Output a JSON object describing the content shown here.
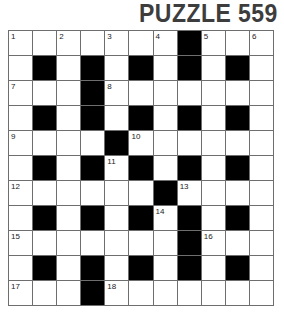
{
  "title": "PUZZLE 559",
  "grid": {
    "rows": 11,
    "cols": 11,
    "colors": {
      "black": "#000000",
      "white": "#ffffff",
      "line": "#6e6e6e",
      "title": "#3d3d3d"
    },
    "layout": [
      [
        "1",
        "",
        "2",
        "",
        "3",
        "",
        "4",
        "#",
        "5",
        "",
        "6"
      ],
      [
        "",
        "#",
        "",
        "#",
        "",
        "#",
        "",
        "#",
        "",
        "#",
        ""
      ],
      [
        "7",
        "",
        "",
        "#",
        "8",
        "",
        "",
        "",
        "",
        "",
        ""
      ],
      [
        "",
        "#",
        "",
        "#",
        "",
        "#",
        "",
        "#",
        "",
        "#",
        ""
      ],
      [
        "9",
        "",
        "",
        "",
        "#",
        "10",
        "",
        "",
        "",
        "",
        ""
      ],
      [
        "",
        "#",
        "",
        "#",
        "11",
        "#",
        "",
        "#",
        "",
        "#",
        ""
      ],
      [
        "12",
        "",
        "",
        "",
        "",
        "",
        "#",
        "13",
        "",
        "",
        ""
      ],
      [
        "",
        "#",
        "",
        "#",
        "",
        "#",
        "14",
        "#",
        "",
        "#",
        ""
      ],
      [
        "15",
        "",
        "",
        "",
        "",
        "",
        "",
        "#",
        "16",
        "",
        ""
      ],
      [
        "",
        "#",
        "",
        "#",
        "",
        "#",
        "",
        "#",
        "",
        "#",
        ""
      ],
      [
        "17",
        "",
        "",
        "#",
        "18",
        "",
        "",
        "",
        "",
        "",
        ""
      ]
    ]
  }
}
